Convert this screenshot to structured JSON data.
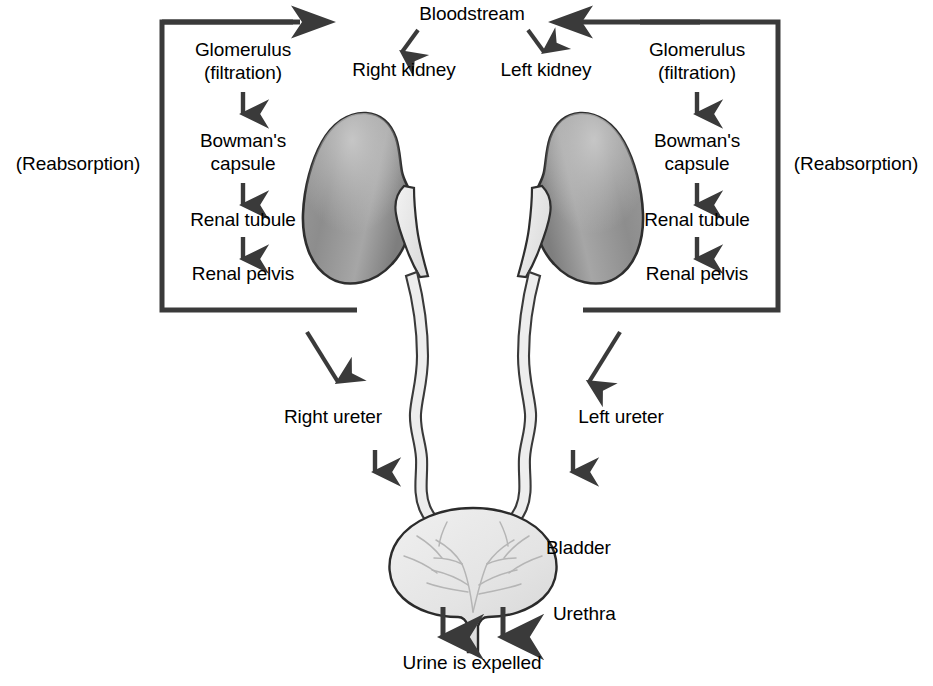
{
  "diagram": {
    "background_color": "#ffffff",
    "text_color": "#000000",
    "line_color": "#3a3a3a",
    "kidney_fill_dark": "#8e8e8e",
    "kidney_fill_light": "#b9b9b9",
    "pelvis_fill": "#e9e9e9",
    "bladder_fill": "#e6e6e6"
  },
  "labels": {
    "bloodstream": "Bloodstream",
    "right_kidney": "Right kidney",
    "left_kidney": "Left kidney",
    "glomerulus_left_line1": "Glomerulus",
    "glomerulus_left_line2": "(filtration)",
    "bowmans_left_line1": "Bowman's",
    "bowmans_left_line2": "capsule",
    "renal_tubule_left": "Renal tubule",
    "renal_pelvis_left": "Renal pelvis",
    "glomerulus_right_line1": "Glomerulus",
    "glomerulus_right_line2": "(filtration)",
    "bowmans_right_line1": "Bowman's",
    "bowmans_right_line2": "capsule",
    "renal_tubule_right": "Renal tubule",
    "renal_pelvis_right": "Renal pelvis",
    "reabsorption_left": "(Reabsorption)",
    "reabsorption_right": "(Reabsorption)",
    "right_ureter": "Right ureter",
    "left_ureter": "Left ureter",
    "bladder": "Bladder",
    "urethra": "Urethra",
    "urine_expelled": "Urine is expelled"
  },
  "flow": {
    "left_sequence": [
      "Glomerulus (filtration)",
      "Bowman's capsule",
      "Renal tubule",
      "Renal pelvis"
    ],
    "right_sequence": [
      "Glomerulus (filtration)",
      "Bowman's capsule",
      "Renal tubule",
      "Renal pelvis"
    ],
    "destination": "Urine is expelled",
    "source": "Bloodstream"
  },
  "anatomy": {
    "organs": [
      "Right kidney",
      "Left kidney",
      "Right ureter",
      "Left ureter",
      "Bladder",
      "Urethra"
    ]
  },
  "icons": {
    "arrow_down": "arrow-down-icon",
    "arrow_right": "arrow-right-icon",
    "arrow_left": "arrow-left-icon",
    "arrow_diagonal": "arrow-diagonal-icon"
  }
}
